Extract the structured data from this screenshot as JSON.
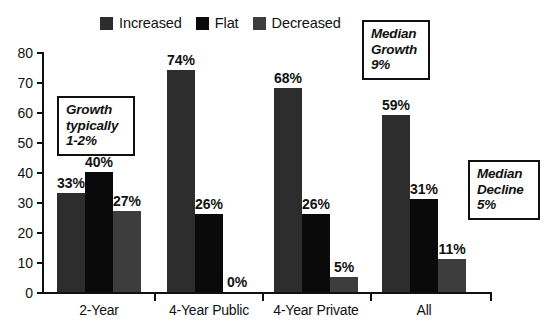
{
  "chart_data": {
    "type": "bar",
    "title": "",
    "subtitle": "",
    "xlabel": "",
    "ylabel": "",
    "grid": false,
    "legend_position": "top",
    "ylim": [
      0,
      80
    ],
    "y_ticks": [
      0,
      10,
      20,
      30,
      40,
      50,
      60,
      70,
      80
    ],
    "y_tick_labels": [
      "0",
      "10",
      "20",
      "30",
      "40",
      "50",
      "60",
      "70",
      "80"
    ],
    "categories": [
      "2-Year",
      "4-Year Public",
      "4-Year Private",
      "All"
    ],
    "series": [
      {
        "name": "Increased",
        "color": "#2d2d2d",
        "values": [
          33,
          74,
          68,
          59
        ],
        "data_labels": [
          "33%",
          "74%",
          "68%",
          "59%"
        ]
      },
      {
        "name": "Flat",
        "color": "#0a0a0a",
        "values": [
          40,
          26,
          26,
          31
        ],
        "data_labels": [
          "40%",
          "26%",
          "26%",
          "31%"
        ]
      },
      {
        "name": "Decreased",
        "color": "#3d3d3d",
        "values": [
          27,
          0,
          5,
          11
        ],
        "data_labels": [
          "27%",
          "0%",
          "5%",
          "11%"
        ]
      }
    ],
    "annotations": [
      {
        "name": "growth-typically",
        "lines": [
          "Growth",
          "typically",
          "1-2%"
        ]
      },
      {
        "name": "median-growth",
        "lines": [
          "Median",
          "Growth",
          "9%"
        ]
      },
      {
        "name": "median-decline",
        "lines": [
          "Median",
          "Decline",
          "5%"
        ]
      }
    ]
  },
  "legend": {
    "items": [
      {
        "label": "Increased",
        "color": "#2d2d2d"
      },
      {
        "label": "Flat",
        "color": "#0a0a0a"
      },
      {
        "label": "Decreased",
        "color": "#3d3d3d"
      }
    ]
  },
  "annotation_growth": {
    "line1": "Growth",
    "line2": "typically",
    "line3": "1-2%"
  },
  "annotation_median_growth": {
    "line1": "Median",
    "line2": "Growth",
    "line3": "9%"
  },
  "annotation_median_decline": {
    "line1": "Median",
    "line2": "Decline",
    "line3": "5%"
  }
}
